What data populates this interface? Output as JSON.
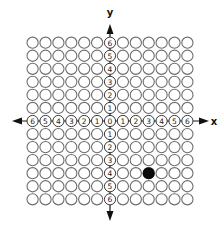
{
  "diagram": {
    "type": "coordinate-plane-circle-grid",
    "x_axis_label": "x",
    "y_axis_label": "y",
    "x_range": [
      -6,
      6
    ],
    "y_range": [
      -6,
      6
    ],
    "x_ticks": [
      "-6",
      "-5",
      "-4",
      "-3",
      "-2",
      "-1",
      "0",
      "1",
      "2",
      "3",
      "4",
      "5",
      "6"
    ],
    "y_ticks": [
      "6",
      "5",
      "4",
      "3",
      "2",
      "1",
      "0",
      "-1",
      "-2",
      "-3",
      "-4",
      "-5",
      "-6"
    ],
    "grid": {
      "columns": 13,
      "rows": 13,
      "cell_shape": "circle"
    },
    "plotted_points": [
      {
        "x": 3,
        "y": -4,
        "style": "filled"
      }
    ],
    "colors": {
      "background": "#ffffff",
      "cell_outline": "#6e6e6e",
      "axis": "#1a1a1a",
      "plotted_point": "#0a0a0a"
    }
  }
}
